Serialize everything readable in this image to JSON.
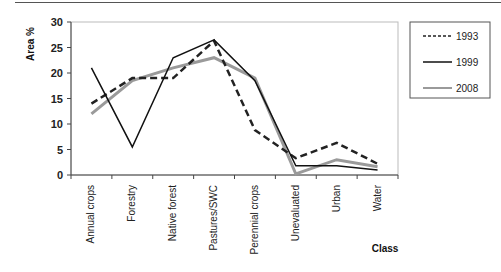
{
  "chart_data": {
    "type": "line",
    "title": "",
    "xlabel": "Class",
    "ylabel": "Area %",
    "ylim": [
      0,
      30
    ],
    "yticks": [
      0,
      5,
      10,
      15,
      20,
      25,
      30
    ],
    "grid": false,
    "legend_position": "right",
    "categories": [
      "Annual crops",
      "Forestry",
      "Native forest",
      "Pastures/SWC",
      "Perennial crops",
      "Unevaluated",
      "Urban",
      "Water"
    ],
    "series": [
      {
        "name": "1993",
        "style": "dashed",
        "color": "#222222",
        "values": [
          14,
          19,
          19,
          26.3,
          8.8,
          3.3,
          6.3,
          2.2
        ]
      },
      {
        "name": "1999",
        "style": "solid",
        "color": "#111111",
        "values": [
          21,
          5.5,
          23,
          26.5,
          18.5,
          1.8,
          1.8,
          1.0
        ]
      },
      {
        "name": "2008",
        "style": "solid",
        "color": "#999999",
        "values": [
          12,
          18.5,
          21,
          23,
          19,
          0.2,
          3,
          1.6
        ]
      }
    ]
  }
}
